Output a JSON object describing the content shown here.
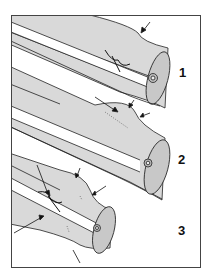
{
  "figure": {
    "frame": {
      "x": 11,
      "y": 15,
      "w": 190,
      "h": 253,
      "stroke": "#444444"
    },
    "colors": {
      "wood": "#d8d8d8",
      "end": "#c9c9c9",
      "outline": "#222222",
      "bg": "#ffffff"
    },
    "panels": [
      {
        "label": "1",
        "label_x": 180,
        "label_y": 66
      },
      {
        "label": "2",
        "label_x": 178,
        "label_y": 153
      },
      {
        "label": "3",
        "label_x": 178,
        "label_y": 224
      }
    ]
  }
}
